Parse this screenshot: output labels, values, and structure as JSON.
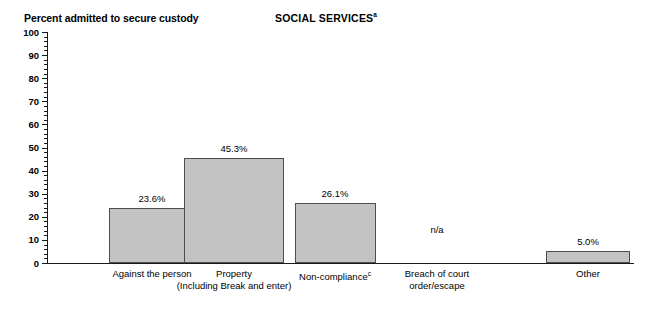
{
  "chart_data": {
    "type": "bar",
    "title": "SOCIAL SERVICES",
    "title_superscript": "a",
    "ylabel": "Percent admitted to secure custody",
    "xlabel": "",
    "ylim": [
      0,
      100
    ],
    "ytick_step": 10,
    "yminor_step": 2,
    "grid": false,
    "legend": null,
    "ytick_labels": [
      "100",
      "90",
      "80",
      "70",
      "60",
      "50",
      "40",
      "30",
      "20",
      "10",
      "0"
    ],
    "ytick_values": [
      100,
      90,
      80,
      70,
      60,
      50,
      40,
      30,
      20,
      10,
      0
    ],
    "categories": [
      "Against the person",
      "Property",
      "Non-compliance",
      "Breach of court order/escape",
      "Other"
    ],
    "category_lines": [
      [
        "Against the person",
        ""
      ],
      [
        "Property",
        "(Including Break and enter)"
      ],
      [
        "Non-compliance",
        ""
      ],
      [
        "Breach of court",
        "order/escape"
      ],
      [
        "Other",
        ""
      ]
    ],
    "category_superscripts": [
      "",
      "",
      "c",
      "",
      ""
    ],
    "values": [
      23.6,
      45.3,
      26.1,
      null,
      5.0
    ],
    "value_labels": [
      "23.6%",
      "45.3%",
      "26.1%",
      "n/a",
      "5.0%"
    ]
  },
  "style": {
    "bar_fill": "#c3c3c3",
    "bar_stroke": "#4d4d4d",
    "axis_color": "#1a1a1a",
    "text_color": "#000000",
    "background": "#ffffff"
  }
}
